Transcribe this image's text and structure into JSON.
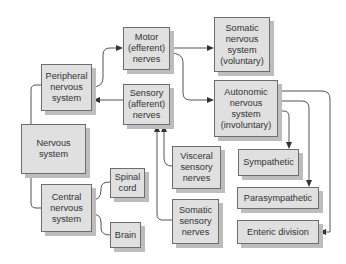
{
  "diagram": {
    "colors": {
      "box_fill": "#e0e0e0",
      "box_border": "#6d6d6d",
      "shadow": "#bdbdbd",
      "line": "#555555"
    },
    "nodes": {
      "nervous_system": "Nervous\nsystem",
      "peripheral": "Peripheral\nnervous\nsystem",
      "central": "Central\nnervous\nsystem",
      "spinal_cord": "Spinal\ncord",
      "brain": "Brain",
      "motor": "Motor\n(efferent)\nnerves",
      "sensory": "Sensory\n(afferent)\nnerves",
      "somatic_nervous": "Somatic\nnervous\nsystem\n(voluntary)",
      "autonomic": "Autonomic\nnervous\nsystem\n(involuntary)",
      "visceral_sensory": "Visceral\nsensory\nnerves",
      "somatic_sensory": "Somatic\nsensory\nnerves",
      "sympathetic": "Sympathetic",
      "parasympathetic": "Parasympathetic",
      "enteric": "Enteric division"
    },
    "edges": [
      {
        "from": "Nervous system",
        "to": "Peripheral nervous system"
      },
      {
        "from": "Nervous system",
        "to": "Central nervous system"
      },
      {
        "from": "Central nervous system",
        "to": "Spinal cord"
      },
      {
        "from": "Central nervous system",
        "to": "Brain"
      },
      {
        "from": "Peripheral nervous system",
        "to": "Motor (efferent) nerves",
        "arrow": true
      },
      {
        "from": "Sensory (afferent) nerves",
        "to": "Peripheral nervous system",
        "arrow": true
      },
      {
        "from": "Motor (efferent) nerves",
        "to": "Somatic nervous system (voluntary)",
        "arrow": true
      },
      {
        "from": "Motor (efferent) nerves",
        "to": "Autonomic nervous system (involuntary)",
        "arrow": true
      },
      {
        "from": "Visceral sensory nerves",
        "to": "Sensory (afferent) nerves",
        "arrow": true
      },
      {
        "from": "Somatic sensory nerves",
        "to": "Sensory (afferent) nerves",
        "arrow": true
      },
      {
        "from": "Autonomic nervous system (involuntary)",
        "to": "Sympathetic",
        "arrow": true
      },
      {
        "from": "Autonomic nervous system (involuntary)",
        "to": "Parasympathetic",
        "arrow": true
      },
      {
        "from": "Autonomic nervous system (involuntary)",
        "to": "Enteric division",
        "arrow": true
      }
    ]
  }
}
